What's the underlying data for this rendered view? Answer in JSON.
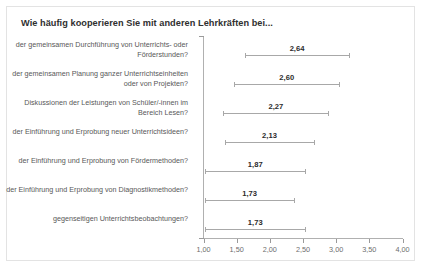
{
  "chart_data": {
    "type": "bar",
    "title": "Wie häufig kooperieren Sie mit anderen Lehrkräften bei...",
    "xlabel": "",
    "ylabel": "",
    "xlim": [
      1.0,
      4.0
    ],
    "xticks": [
      "1,00",
      "1,50",
      "2,00",
      "2,50",
      "3,00",
      "3,50",
      "4,00"
    ],
    "xtick_values": [
      1.0,
      1.5,
      2.0,
      2.5,
      3.0,
      3.5,
      4.0
    ],
    "grid": false,
    "legend": "none",
    "orientation": "horizontal",
    "categories": [
      "der gemeinsamen Durchführung von Unterrichts- oder Förderstunden?",
      "der gemeinsamen Planung ganzer Unterrichtseinheiten oder von Projekten?",
      "Diskussionen der Leistungen von Schüler/-innen im Bereich Lesen?",
      "der Einführung und Erprobung neuer Unterrichtsideen?",
      "der Einführung und Erprobung von Fördermethoden?",
      "der Einführung und Erprobung von Diagnostikmethoden?",
      "gegenseitigen Unterrichtsbeobachtungen?"
    ],
    "values": [
      2.64,
      2.6,
      2.27,
      2.13,
      1.87,
      1.73,
      1.73
    ],
    "value_labels": [
      "2,64",
      "2,60",
      "2,27",
      "2,13",
      "1,87",
      "1,73",
      "1,73"
    ],
    "intervals": [
      {
        "low": 1.62,
        "high": 3.2
      },
      {
        "low": 1.46,
        "high": 3.05
      },
      {
        "low": 1.3,
        "high": 2.88
      },
      {
        "low": 1.33,
        "high": 2.66
      },
      {
        "low": 1.03,
        "high": 2.53
      },
      {
        "low": 1.03,
        "high": 2.36
      },
      {
        "low": 1.03,
        "high": 2.53
      }
    ]
  },
  "colors": {
    "line": "#a8a8a8",
    "axis": "#9a9a9a",
    "label": "#585858",
    "value": "#2b2b2b",
    "border": "#e3e3e3"
  }
}
